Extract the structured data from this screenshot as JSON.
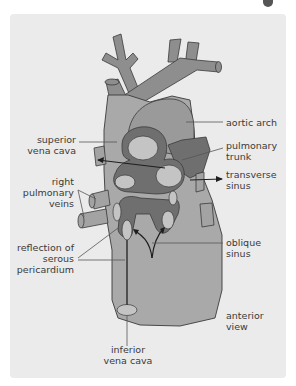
{
  "figure": {
    "background": "#ebebeb",
    "colors": {
      "vessel": "#8e8e8e",
      "heart": "#a9a9a9",
      "pericardium_dark": "#6f6f6f",
      "sinus_light": "#c4c4c4",
      "outline": "#3a3a3a",
      "arrow": "#1e1e1e"
    },
    "labels": {
      "aortic_arch": "aortic arch",
      "superior_vena_cava": [
        "superior",
        "vena cava"
      ],
      "pulmonary_trunk": [
        "pulmonary",
        "trunk"
      ],
      "transverse_sinus": [
        "transverse",
        "sinus"
      ],
      "right_pulmonary_veins": [
        "right",
        "pulmonary",
        "veins"
      ],
      "reflection_of_serous_pericardium": [
        "reflection of",
        "serous",
        "pericardium"
      ],
      "oblique_sinus": [
        "oblique",
        "sinus"
      ],
      "anterior_view": [
        "anterior",
        "view"
      ],
      "inferior_vena_cava": [
        "inferior",
        "vena cava"
      ]
    }
  }
}
